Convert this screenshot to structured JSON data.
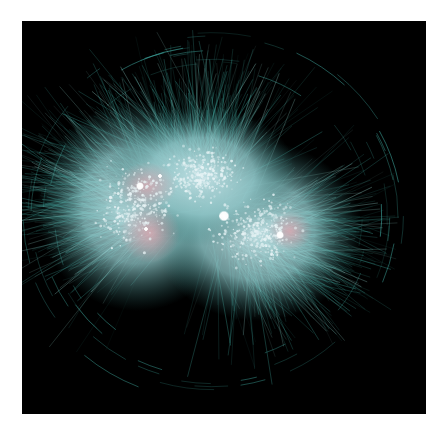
{
  "figure": {
    "type": "network-visualization",
    "background": "#000000",
    "panel": {
      "x": 22,
      "y": 21,
      "width": 404,
      "height": 393
    }
  },
  "palette": {
    "edge": "#3fa9a0",
    "edge_bright": "#9fe3dc",
    "cloud": "#8fc6c8",
    "cloud_core": "#c9e6ea",
    "cluster_pink": "#d99aa6",
    "node": "#e8f4f6",
    "hub": "#ffffff"
  },
  "clouds": [
    {
      "cx": 115,
      "cy": 185,
      "rx": 100,
      "ry": 105
    },
    {
      "cx": 235,
      "cy": 210,
      "rx": 105,
      "ry": 90
    },
    {
      "cx": 180,
      "cy": 155,
      "rx": 95,
      "ry": 70
    }
  ],
  "pink_clusters": [
    {
      "cx": 125,
      "cy": 165,
      "rx": 30,
      "ry": 24
    },
    {
      "cx": 128,
      "cy": 212,
      "rx": 30,
      "ry": 30
    },
    {
      "cx": 268,
      "cy": 210,
      "rx": 22,
      "ry": 20
    }
  ],
  "hubs": [
    {
      "cx": 118,
      "cy": 165,
      "r": 4
    },
    {
      "cx": 202,
      "cy": 195,
      "r": 5.5
    },
    {
      "cx": 258,
      "cy": 214,
      "r": 4
    },
    {
      "cx": 124,
      "cy": 208,
      "r": 2.2
    },
    {
      "cx": 138,
      "cy": 155,
      "r": 2.2
    }
  ],
  "generation": {
    "seed": 7,
    "edges": 1400,
    "nodes": 900,
    "outer_arcs": 60
  }
}
